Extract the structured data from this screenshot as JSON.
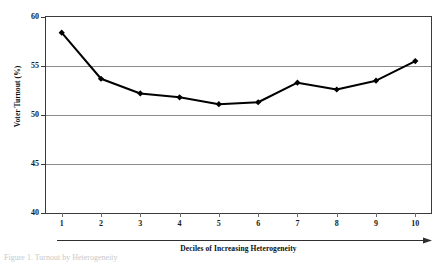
{
  "chart_data": {
    "type": "line",
    "title": "",
    "subtitle": "",
    "xlabel": "Deciles of Increasing Heterogeneity",
    "ylabel": "Voter Turnout (%)",
    "categories": [
      "1",
      "2",
      "3",
      "4",
      "5",
      "6",
      "7",
      "8",
      "9",
      "10"
    ],
    "x": [
      1,
      2,
      3,
      4,
      5,
      6,
      7,
      8,
      9,
      10
    ],
    "values": [
      58.4,
      53.7,
      52.2,
      51.8,
      51.1,
      51.3,
      53.3,
      52.6,
      53.5,
      55.5
    ],
    "series": [
      {
        "name": "Voter Turnout",
        "values": [
          58.4,
          53.7,
          52.2,
          51.8,
          51.1,
          51.3,
          53.3,
          52.6,
          53.5,
          55.5
        ]
      }
    ],
    "ylim": [
      40,
      60
    ],
    "xlim": [
      0.6,
      10.4
    ],
    "yticks": [
      40,
      45,
      50,
      55,
      60
    ],
    "ytick_labels": [
      "40",
      "45",
      "50",
      "55",
      "60"
    ],
    "xticks": [
      1,
      2,
      3,
      4,
      5,
      6,
      7,
      8,
      9,
      10
    ],
    "xtick_labels": [
      "1",
      "2",
      "3",
      "4",
      "5",
      "6",
      "7",
      "8",
      "9",
      "10"
    ],
    "grid": "horizontal",
    "legend": "none",
    "marker": "diamond",
    "line_color": "#000000",
    "marker_color": "#000000",
    "grid_color": "#8c8c8c",
    "axis_color": "#3a3a3a",
    "background": "#ffffff"
  },
  "axes": {
    "y_label": "Voter Turnout (%)",
    "x_label": "Deciles of Increasing Heterogeneity",
    "y_ticks": [
      "60",
      "55",
      "50",
      "45",
      "40"
    ],
    "x_ticks": [
      "1",
      "2",
      "3",
      "4",
      "5",
      "6",
      "7",
      "8",
      "9",
      "10"
    ]
  },
  "caption": {
    "fragment": "Figure 1. Turnout by Heterogeneity"
  }
}
